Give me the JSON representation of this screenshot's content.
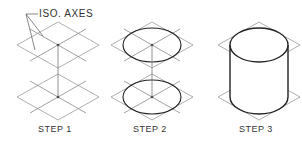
{
  "diagram": {
    "callout": "ISO. AXES",
    "steps": [
      {
        "label": "STEP 1"
      },
      {
        "label": "STEP 2"
      },
      {
        "label": "STEP 3"
      }
    ],
    "colors": {
      "thin_line": "#9a9a9a",
      "thick_line": "#222222",
      "text": "#333333",
      "background": "#ffffff"
    }
  }
}
